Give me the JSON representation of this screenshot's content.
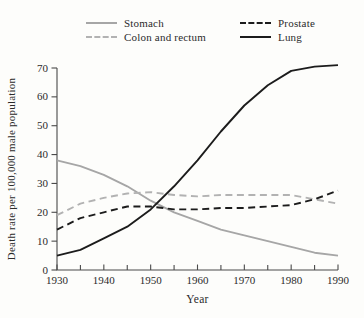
{
  "figure": {
    "background": "#fdfdfb"
  },
  "colors": {
    "stomach_line": "#a6a6a6",
    "colon_line": "#b2b2b2",
    "black_line": "#1c1c1c",
    "axis": "#4a4a4a",
    "text": "#2b2b2b"
  },
  "legend": {
    "columns": [
      {
        "items": [
          {
            "label": "Stomach",
            "swatch": "solid-gray"
          },
          {
            "label": "Colon and rectum",
            "swatch": "dashed-gray"
          }
        ]
      },
      {
        "items": [
          {
            "label": "Prostate",
            "swatch": "dashed-black"
          },
          {
            "label": "Lung",
            "swatch": "solid-black"
          }
        ]
      }
    ]
  },
  "chart_data": {
    "type": "line",
    "title": "",
    "xlabel": "Year",
    "ylabel": "Death rate per 100,000 male population",
    "xlim": [
      1930,
      1990
    ],
    "ylim": [
      0,
      70
    ],
    "yticks": [
      0,
      10,
      20,
      30,
      40,
      50,
      60,
      70
    ],
    "xticks_major": [
      1930,
      1940,
      1950,
      1960,
      1970,
      1980,
      1990
    ],
    "xticks_minor": [
      1935,
      1945,
      1955,
      1965,
      1975,
      1985
    ],
    "grid": false,
    "legend_position": "top",
    "x": [
      1930,
      1935,
      1940,
      1945,
      1950,
      1955,
      1960,
      1965,
      1970,
      1975,
      1980,
      1985,
      1990
    ],
    "series": [
      {
        "name": "Stomach",
        "color": "#a6a6a6",
        "dash": "solid",
        "values": [
          38,
          36,
          33,
          29,
          24,
          20,
          17,
          14,
          12,
          10,
          8,
          6,
          5
        ]
      },
      {
        "name": "Colon and rectum",
        "color": "#b2b2b2",
        "dash": "dashed",
        "values": [
          19,
          23,
          25,
          26.5,
          27,
          26,
          25.5,
          26,
          26,
          26,
          26,
          24.5,
          23
        ]
      },
      {
        "name": "Prostate",
        "color": "#1c1c1c",
        "dash": "dashed",
        "values": [
          14,
          18,
          20,
          22,
          22,
          21,
          21,
          21.5,
          21.5,
          22,
          22.5,
          24.5,
          27.5
        ]
      },
      {
        "name": "Lung",
        "color": "#1c1c1c",
        "dash": "solid",
        "values": [
          5,
          7,
          11,
          15,
          21,
          29,
          38,
          48,
          57,
          64,
          69,
          70.5,
          71
        ]
      }
    ]
  }
}
